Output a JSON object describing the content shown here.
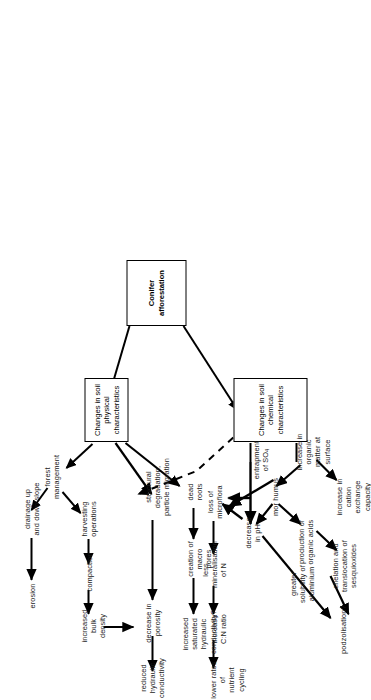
{
  "diagram": {
    "orientation": "rotated-90-ccw",
    "stroke_color": "#000000",
    "background_color": "#ffffff",
    "boxes": {
      "root": "Conifer\nafforestation",
      "physical": "Changes in soil\nphysical characteristics",
      "chemical": "Changes in soil\nchemical characteristics"
    },
    "physical_branch": {
      "forest_management": "forest\nmanagement",
      "drainage": "drainage up\nand down slope",
      "erosion": "erosion",
      "harvesting": "harvesting\noperations",
      "compaction": "compaction",
      "bulk_density": "increased\nbulk density",
      "structural": "structural degradation,\nparticle migration",
      "porosity": "decrease in\nporosity",
      "reduced_hydraulic": "reduced\nhydraulic\nconductivity",
      "dead_roots": "dead\nroots",
      "macro_pores": "creation of\nmacro pores",
      "increased_hydraulic": "increased\nsaturated\nhydraulic\nconductivity?"
    },
    "chemical_branch": {
      "entrapment": "entrapment\nof SO",
      "entrapment_sub": "4",
      "organic_matter": "increase in organic\nmatter at surface",
      "cation_exchange": "increase in cation\nexchange capacity",
      "mor_humus": "mor humus",
      "loss_microflora": "loss of\nmicroflora",
      "decrease_ph": "decrease\nin pH",
      "mineralisation": "less\nmineralisation\nof N",
      "cn_ratio": "increase C:N ratio",
      "nutrient_cycling": "lower rates of\nnutrient cycling",
      "organic_acids": "production of\norganic acids",
      "chelation": "chelation and\ntranslocation of\nsesquioxides",
      "solubility": "greater\nsolubility of\naluminium",
      "podzolisation": "podzolisation?"
    }
  }
}
